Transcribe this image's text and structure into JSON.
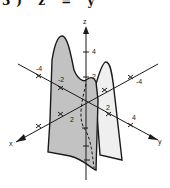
{
  "figure": {
    "caption_fragment": "3)  z = y",
    "colors": {
      "ink": "#1a1a1a",
      "surface_front": "#bdbdbd",
      "surface_back": "#eeeeee",
      "background": "#ffffff"
    }
  },
  "axes": {
    "z": {
      "label": "z",
      "ticks": [
        "2",
        "4"
      ]
    },
    "x": {
      "label": "x",
      "ticks": [
        "-2",
        "2"
      ]
    },
    "y": {
      "label": "y",
      "ticks": [
        "-4",
        "2",
        "4"
      ]
    },
    "left_axis_ticks": [
      "-4",
      "-2"
    ],
    "right_axis_ticks": [
      "-4"
    ]
  },
  "labels": {
    "z_axis": "z",
    "x_axis": "x",
    "y_axis": "y",
    "z_tick_4": "4",
    "z_tick_2": "2",
    "left_tick_neg4": "-4",
    "left_tick_neg2": "-2",
    "right_tick_neg4": "-4",
    "front_tick_2": "2",
    "front_tick_4": "4",
    "x_tick_2": "2"
  }
}
